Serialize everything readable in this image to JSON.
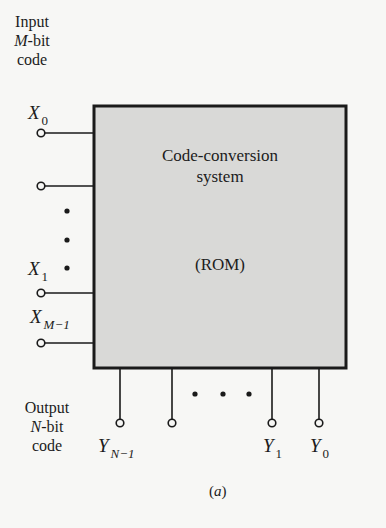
{
  "diagram": {
    "box": {
      "title_line1": "Code-conversion",
      "title_line2": "system",
      "subtitle": "(ROM)",
      "fill": "#d9d9d7",
      "stroke": "#1a1a1a"
    },
    "input": {
      "group_label_line1": "Input",
      "group_label_line2_italic": "M",
      "group_label_line2_rest": "-bit",
      "group_label_line3": "code",
      "terminals": [
        {
          "symbol": "X",
          "subscript": "0"
        },
        {
          "symbol": "",
          "subscript": ""
        },
        {
          "symbol": "X",
          "subscript": "1"
        },
        {
          "symbol": "X",
          "subscript": "M−1"
        }
      ],
      "ellipsis": "• • •"
    },
    "output": {
      "group_label_line1": "Output",
      "group_label_line2_italic": "N",
      "group_label_line2_rest": "-bit",
      "group_label_line3": "code",
      "terminals": [
        {
          "symbol": "Y",
          "subscript": "N−1"
        },
        {
          "symbol": "",
          "subscript": ""
        },
        {
          "symbol": "Y",
          "subscript": "1"
        },
        {
          "symbol": "Y",
          "subscript": "0"
        }
      ],
      "ellipsis": "• • •"
    },
    "caption": "a"
  }
}
